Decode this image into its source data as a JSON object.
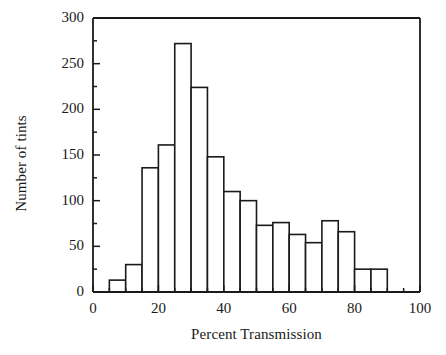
{
  "chart_data": {
    "type": "bar",
    "subtype": "histogram",
    "title": "",
    "xlabel": "Percent Transmission",
    "ylabel": "Number of tints",
    "xlim": [
      0,
      100
    ],
    "ylim": [
      0,
      300
    ],
    "bin_width": 5,
    "grid": false,
    "legend": null,
    "x_major_ticks": [
      0,
      20,
      40,
      60,
      80,
      100
    ],
    "x_major_tick_labels": [
      "0",
      "20",
      "40",
      "60",
      "80",
      "100"
    ],
    "x_minor_tick_step": 5,
    "y_major_ticks": [
      0,
      50,
      100,
      150,
      200,
      250,
      300
    ],
    "y_major_tick_labels": [
      "0",
      "50",
      "100",
      "150",
      "200",
      "250",
      "300"
    ],
    "y_minor_tick_step": 25,
    "bin_edges": [
      0,
      5,
      10,
      15,
      20,
      25,
      30,
      35,
      40,
      45,
      50,
      55,
      60,
      65,
      70,
      75,
      80,
      85,
      90,
      95,
      100
    ],
    "categories": [
      "0-5",
      "5-10",
      "10-15",
      "15-20",
      "20-25",
      "25-30",
      "30-35",
      "35-40",
      "40-45",
      "45-50",
      "50-55",
      "55-60",
      "60-65",
      "65-70",
      "70-75",
      "75-80",
      "80-85",
      "85-90",
      "90-95",
      "95-100"
    ],
    "values": [
      0,
      13,
      30,
      136,
      161,
      272,
      224,
      148,
      110,
      100,
      73,
      76,
      63,
      54,
      78,
      66,
      25,
      25,
      0,
      0
    ],
    "bar_fill_color": "#ffffff",
    "bar_edge_color": "#1a1a1a",
    "axis_color": "#1a1a1a"
  },
  "axes": {
    "ylabel": "Number of tints",
    "xlabel": "Percent Transmission"
  }
}
